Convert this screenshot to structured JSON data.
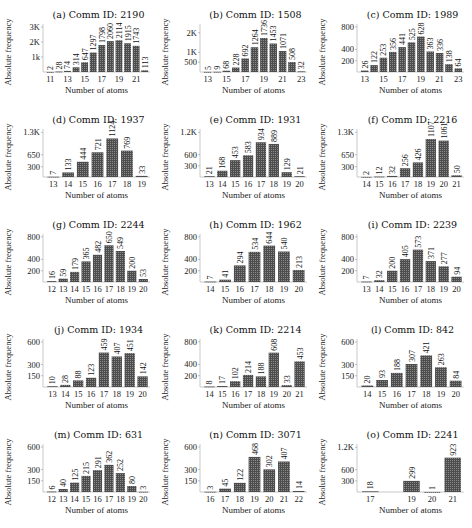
{
  "figure": {
    "xlabel": "Number of atoms",
    "ylabel": "Absolute frequency",
    "bar_color": "#4d4d4d",
    "bar_pattern": "dotted-hatch"
  },
  "chart_data": [
    {
      "id": "a",
      "type": "bar",
      "title": "(a) Comm ID: 2190",
      "xlabel": "Number of atoms",
      "ylabel": "Absolute frequency",
      "categories": [
        11,
        12,
        13,
        14,
        15,
        16,
        17,
        18,
        19,
        20,
        21,
        22
      ],
      "values": [
        2,
        28,
        74,
        314,
        647,
        1297,
        1798,
        2060,
        2114,
        1915,
        1743,
        113
      ],
      "xticks": [
        11,
        13,
        15,
        17,
        19,
        21
      ],
      "yticks": [
        {
          "v": 1000,
          "label": "1k"
        },
        {
          "v": 2000,
          "label": "2K"
        },
        {
          "v": 3000,
          "label": "3K"
        }
      ],
      "ylim": [
        0,
        3200
      ]
    },
    {
      "id": "b",
      "type": "bar",
      "title": "(b) Comm ID: 1508",
      "xlabel": "Number of atoms",
      "ylabel": "Absolute frequency",
      "categories": [
        13,
        14,
        15,
        16,
        17,
        18,
        19,
        20,
        21,
        22,
        23
      ],
      "values": [
        5,
        9,
        68,
        228,
        692,
        1264,
        1736,
        1453,
        1071,
        508,
        32
      ],
      "xticks": [
        13,
        15,
        17,
        19,
        21,
        23
      ],
      "yticks": [
        {
          "v": 500,
          "label": "500"
        },
        {
          "v": 1000,
          "label": "1K"
        },
        {
          "v": 2000,
          "label": "2K"
        }
      ],
      "ylim": [
        0,
        2450
      ]
    },
    {
      "id": "c",
      "type": "bar",
      "title": "(c) Comm ID: 1989",
      "xlabel": "Number of atoms",
      "ylabel": "Absolute frequency",
      "categories": [
        13,
        14,
        15,
        16,
        17,
        18,
        19,
        20,
        21,
        22,
        23
      ],
      "values": [
        26,
        122,
        253,
        356,
        441,
        525,
        628,
        363,
        336,
        138,
        64
      ],
      "xticks": [
        13,
        15,
        17,
        19,
        21,
        23
      ],
      "yticks": [
        {
          "v": 200,
          "label": "200"
        },
        {
          "v": 400,
          "label": "400"
        },
        {
          "v": 800,
          "label": "800"
        }
      ],
      "ylim": [
        0,
        850
      ]
    },
    {
      "id": "d",
      "type": "bar",
      "title": "(d) Comm ID: 1937",
      "xlabel": "Number of atoms",
      "ylabel": "Absolute frequency",
      "categories": [
        13,
        14,
        15,
        16,
        17,
        18,
        19
      ],
      "values": [
        7,
        133,
        444,
        721,
        1124,
        769,
        33
      ],
      "xticks": [
        13,
        14,
        15,
        16,
        17,
        18,
        19
      ],
      "yticks": [
        {
          "v": 300,
          "label": "300"
        },
        {
          "v": 650,
          "label": "650"
        },
        {
          "v": 1300,
          "label": "1.3K"
        }
      ],
      "ylim": [
        0,
        1400
      ]
    },
    {
      "id": "e",
      "type": "bar",
      "title": "(e) Comm ID: 1931",
      "xlabel": "Number of atoms",
      "ylabel": "Absolute frequency",
      "categories": [
        13,
        14,
        15,
        16,
        17,
        18,
        19,
        20
      ],
      "values": [
        21,
        168,
        453,
        583,
        934,
        889,
        129,
        21
      ],
      "xticks": [
        13,
        14,
        15,
        16,
        17,
        18,
        19,
        20
      ],
      "yticks": [
        {
          "v": 300,
          "label": "300"
        },
        {
          "v": 600,
          "label": "600"
        },
        {
          "v": 1200,
          "label": "1.2K"
        }
      ],
      "ylim": [
        0,
        1290
      ]
    },
    {
      "id": "f",
      "type": "bar",
      "title": "(f) Comm ID: 2216",
      "xlabel": "Number of atoms",
      "ylabel": "Absolute frequency",
      "categories": [
        14,
        15,
        16,
        17,
        18,
        19,
        20,
        21
      ],
      "values": [
        2,
        12,
        32,
        256,
        426,
        1107,
        1061,
        50
      ],
      "xticks": [
        14,
        15,
        16,
        17,
        18,
        19,
        20,
        21
      ],
      "yticks": [
        {
          "v": 300,
          "label": "300"
        },
        {
          "v": 650,
          "label": "650"
        },
        {
          "v": 1300,
          "label": "1.3K"
        }
      ],
      "ylim": [
        0,
        1400
      ]
    },
    {
      "id": "g",
      "type": "bar",
      "title": "(g) Comm ID: 2244",
      "xlabel": "Number of atoms",
      "ylabel": "Absolute frequency",
      "categories": [
        12,
        13,
        14,
        15,
        16,
        17,
        18,
        19,
        20
      ],
      "values": [
        16,
        59,
        179,
        365,
        482,
        650,
        549,
        200,
        53
      ],
      "xticks": [
        12,
        13,
        14,
        15,
        16,
        17,
        18,
        19,
        20
      ],
      "yticks": [
        {
          "v": 200,
          "label": "200"
        },
        {
          "v": 400,
          "label": "400"
        },
        {
          "v": 800,
          "label": "800"
        }
      ],
      "ylim": [
        0,
        850
      ]
    },
    {
      "id": "h",
      "type": "bar",
      "title": "(h) Comm ID: 1962",
      "xlabel": "Number of atoms",
      "ylabel": "Absolute frequency",
      "categories": [
        14,
        15,
        16,
        17,
        18,
        19,
        20
      ],
      "values": [
        7,
        41,
        294,
        534,
        644,
        540,
        213
      ],
      "xticks": [
        14,
        15,
        16,
        17,
        18,
        19,
        20
      ],
      "yticks": [
        {
          "v": 200,
          "label": "200"
        },
        {
          "v": 400,
          "label": "400"
        },
        {
          "v": 800,
          "label": "800"
        }
      ],
      "ylim": [
        0,
        850
      ]
    },
    {
      "id": "i",
      "type": "bar",
      "title": "(i) Comm ID: 2239",
      "xlabel": "Number of atoms",
      "ylabel": "Absolute frequency",
      "categories": [
        13,
        14,
        15,
        16,
        17,
        18,
        19,
        20
      ],
      "values": [
        7,
        32,
        200,
        405,
        573,
        371,
        277,
        94
      ],
      "xticks": [
        13,
        14,
        15,
        16,
        17,
        18,
        19,
        20
      ],
      "yticks": [
        {
          "v": 200,
          "label": "200"
        },
        {
          "v": 400,
          "label": "400"
        },
        {
          "v": 800,
          "label": "800"
        }
      ],
      "ylim": [
        0,
        850
      ]
    },
    {
      "id": "j",
      "type": "bar",
      "title": "(j) Comm ID: 1934",
      "xlabel": "Number of atoms",
      "ylabel": "Absolute frequency",
      "categories": [
        13,
        14,
        15,
        16,
        17,
        18,
        19,
        20
      ],
      "values": [
        10,
        28,
        88,
        123,
        459,
        407,
        451,
        142
      ],
      "xticks": [
        13,
        14,
        15,
        16,
        17,
        18,
        19,
        20
      ],
      "yticks": [
        {
          "v": 150,
          "label": "150"
        },
        {
          "v": 300,
          "label": "300"
        },
        {
          "v": 600,
          "label": "600"
        }
      ],
      "ylim": [
        0,
        640
      ]
    },
    {
      "id": "k",
      "type": "bar",
      "title": "(k) Comm ID: 2214",
      "xlabel": "Number of atoms",
      "ylabel": "Absolute frequency",
      "categories": [
        14,
        15,
        16,
        17,
        18,
        19,
        20,
        21
      ],
      "values": [
        8,
        17,
        102,
        214,
        188,
        608,
        33,
        453
      ],
      "xticks": [
        14,
        15,
        16,
        17,
        18,
        19,
        20,
        21
      ],
      "yticks": [
        {
          "v": 200,
          "label": "200"
        },
        {
          "v": 400,
          "label": "400"
        },
        {
          "v": 800,
          "label": "800"
        }
      ],
      "ylim": [
        0,
        850
      ]
    },
    {
      "id": "l",
      "type": "bar",
      "title": "(l) Comm ID: 842",
      "xlabel": "Number of atoms",
      "ylabel": "Absolute frequency",
      "categories": [
        14,
        15,
        16,
        17,
        18,
        19,
        20
      ],
      "values": [
        20,
        93,
        188,
        307,
        421,
        263,
        84
      ],
      "xticks": [
        14,
        15,
        16,
        17,
        18,
        19,
        20
      ],
      "yticks": [
        {
          "v": 150,
          "label": "150"
        },
        {
          "v": 300,
          "label": "300"
        },
        {
          "v": 600,
          "label": "600"
        }
      ],
      "ylim": [
        0,
        640
      ]
    },
    {
      "id": "m",
      "type": "bar",
      "title": "(m) Comm ID: 631",
      "xlabel": "Number of atoms",
      "ylabel": "Absolute frequency",
      "categories": [
        12,
        13,
        14,
        15,
        16,
        17,
        18,
        19,
        20
      ],
      "values": [
        6,
        40,
        125,
        215,
        291,
        362,
        252,
        80,
        3
      ],
      "xticks": [
        12,
        13,
        14,
        15,
        16,
        17,
        18,
        19,
        20
      ],
      "yticks": [
        {
          "v": 150,
          "label": "150"
        },
        {
          "v": 300,
          "label": "300"
        },
        {
          "v": 600,
          "label": "600"
        }
      ],
      "ylim": [
        0,
        640
      ]
    },
    {
      "id": "n",
      "type": "bar",
      "title": "(n) Comm ID: 3071",
      "xlabel": "Number of atoms",
      "ylabel": "Absolute frequency",
      "categories": [
        16,
        17,
        18,
        19,
        20,
        21,
        22
      ],
      "values": [
        3,
        45,
        122,
        468,
        302,
        407,
        14
      ],
      "xticks": [
        16,
        17,
        18,
        19,
        20,
        21,
        22
      ],
      "yticks": [
        {
          "v": 150,
          "label": "150"
        },
        {
          "v": 300,
          "label": "300"
        },
        {
          "v": 600,
          "label": "600"
        }
      ],
      "ylim": [
        0,
        640
      ]
    },
    {
      "id": "o",
      "type": "bar",
      "title": "(o) Comm ID: 2241",
      "xlabel": "Number of atoms",
      "ylabel": "Absolute frequency",
      "categories": [
        17,
        18,
        19,
        20,
        21
      ],
      "values": [
        18,
        0,
        299,
        1,
        923
      ],
      "xticks": [
        17,
        19,
        20,
        21
      ],
      "yticks": [
        {
          "v": 300,
          "label": "300"
        },
        {
          "v": 600,
          "label": "600"
        },
        {
          "v": 1200,
          "label": "1.2K"
        }
      ],
      "ylim": [
        0,
        1290
      ],
      "hide_zero_labels": true
    }
  ]
}
